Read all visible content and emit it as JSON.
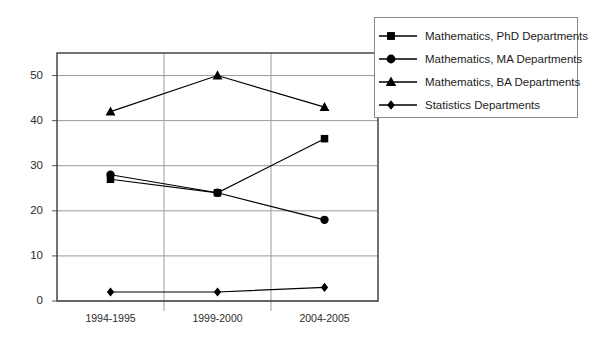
{
  "chart_data": {
    "type": "line",
    "title": "",
    "xlabel": "",
    "ylabel": "",
    "categories": [
      "1994-1995",
      "1999-2000",
      "2004-2005"
    ],
    "ylim": [
      0,
      55
    ],
    "yticks": [
      0,
      10,
      20,
      30,
      40,
      50
    ],
    "grid": true,
    "legend_position": "top-right-outside",
    "series": [
      {
        "name": "Mathematics, PhD Departments",
        "marker": "square",
        "color": "#000000",
        "values": [
          27,
          24,
          36
        ]
      },
      {
        "name": "Mathematics, MA Departments",
        "marker": "circle",
        "color": "#000000",
        "values": [
          28,
          24,
          18
        ]
      },
      {
        "name": "Mathematics, BA Departments",
        "marker": "triangle",
        "color": "#000000",
        "values": [
          42,
          50,
          43
        ]
      },
      {
        "name": "Statistics Departments",
        "marker": "diamond",
        "color": "#000000",
        "values": [
          2,
          2,
          3
        ]
      }
    ]
  },
  "axis": {
    "ytick_labels": [
      "0",
      "10",
      "20",
      "30",
      "40",
      "50"
    ],
    "xtick_labels": [
      "1994-1995",
      "1999-2000",
      "2004-2005"
    ]
  },
  "legend": {
    "items": [
      {
        "label": "Mathematics, PhD Departments",
        "marker": "square-marker-icon"
      },
      {
        "label": "Mathematics, MA Departments",
        "marker": "circle-marker-icon"
      },
      {
        "label": "Mathematics, BA Departments",
        "marker": "triangle-marker-icon"
      },
      {
        "label": "Statistics Departments",
        "marker": "diamond-marker-icon"
      }
    ]
  },
  "colors": {
    "background": "#ffffff",
    "frame": "#3a3a3a",
    "grid": "#9a9a9a",
    "series": "#000000",
    "legend_border": "#8a8a8a"
  }
}
